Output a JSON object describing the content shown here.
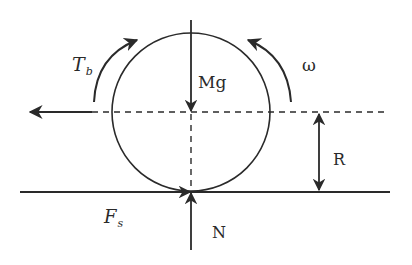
{
  "diagram": {
    "type": "free-body diagram",
    "colors": {
      "stroke": "#2a2a2a",
      "background": "#ffffff"
    },
    "labels": {
      "braking_torque": {
        "main": "T",
        "sub": "b"
      },
      "angular_velocity": "ω",
      "weight": "Mg",
      "radius": "R",
      "friction": {
        "main": "F",
        "sub": "s"
      },
      "normal": "N"
    }
  }
}
